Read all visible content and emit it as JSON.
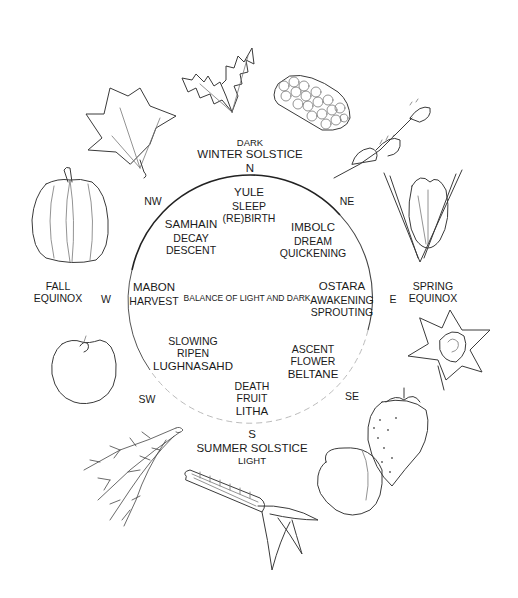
{
  "diagram": {
    "title_north": {
      "top": "DARK",
      "middle": "WINTER SOLSTICE",
      "direction": "N"
    },
    "title_south": {
      "direction": "S",
      "middle": "SUMMER SOLSTICE",
      "bottom": "LIGHT"
    },
    "title_east": {
      "direction": "E",
      "line1": "SPRING",
      "line2": "EQUINOX"
    },
    "title_west": {
      "direction": "W",
      "line1": "FALL",
      "line2": "EQUINOX"
    },
    "directions": {
      "nw": "NW",
      "ne": "NE",
      "sw": "SW",
      "se": "SE"
    },
    "center": "BALANCE OF LIGHT AND DARK",
    "festivals": {
      "yule": {
        "name": "YULE",
        "line2": "SLEEP",
        "line3": "(RE)BIRTH"
      },
      "imbolc": {
        "name": "IMBOLC",
        "line2": "DREAM",
        "line3": "QUICKENING"
      },
      "ostara": {
        "name": "OSTARA",
        "line2": "AWAKENING",
        "line3": "SPROUTING"
      },
      "beltane": {
        "line1": "ASCENT",
        "line2": "FLOWER",
        "name": "BELTANE"
      },
      "litha": {
        "line1": "DEATH",
        "line2": "FRUIT",
        "name": "LITHA"
      },
      "lughnasahd": {
        "line1": "SLOWING",
        "line2": "RIPEN",
        "name": "LUGHNASAHD"
      },
      "mabon": {
        "name": "MABON",
        "line2": "HARVEST"
      },
      "samhain": {
        "name": "SAMHAIN",
        "line2": "DECAY",
        "line3": "DESCENT"
      }
    },
    "illustrations": [
      "holly-leaf",
      "pine-cone",
      "sprouting-twig",
      "crocus-flower",
      "daffodil-flower",
      "strawberry",
      "peach",
      "corn-cob",
      "wheat-sheaf",
      "apple",
      "pumpkin",
      "maple-leaf"
    ],
    "colors": {
      "ink": "#1a1a1a",
      "sketch": "#3a3a3a",
      "background": "#ffffff"
    }
  }
}
